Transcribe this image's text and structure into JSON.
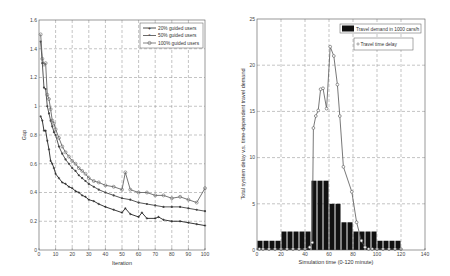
{
  "chart_data": [
    {
      "type": "line",
      "title": "",
      "xlabel": "Iteration",
      "ylabel": "Gap",
      "xlim": [
        0,
        100
      ],
      "ylim": [
        0,
        1.6
      ],
      "xticks": [
        "0",
        "10",
        "20",
        "30",
        "40",
        "50",
        "60",
        "70",
        "80",
        "90",
        "100"
      ],
      "yticks": [
        "0",
        "0.2",
        "0.4",
        "0.6",
        "0.8",
        "1",
        "1.2",
        "1.4",
        "1.6"
      ],
      "grid": true,
      "legend_position": "upper right",
      "series": [
        {
          "name": "20% guided users",
          "color": "#222222",
          "marker": "+",
          "x": [
            1,
            2,
            3,
            4,
            5,
            6,
            7,
            8,
            9,
            10,
            12,
            14,
            16,
            18,
            20,
            22,
            24,
            26,
            28,
            30,
            33,
            36,
            40,
            45,
            50,
            52,
            55,
            60,
            62,
            65,
            70,
            72,
            75,
            80,
            85,
            90,
            95,
            100
          ],
          "values": [
            0.93,
            0.9,
            0.83,
            0.83,
            0.76,
            0.7,
            0.62,
            0.6,
            0.57,
            0.53,
            0.5,
            0.47,
            0.46,
            0.44,
            0.43,
            0.41,
            0.4,
            0.38,
            0.37,
            0.35,
            0.34,
            0.32,
            0.3,
            0.28,
            0.26,
            0.29,
            0.25,
            0.23,
            0.26,
            0.22,
            0.22,
            0.23,
            0.21,
            0.2,
            0.2,
            0.19,
            0.18,
            0.17
          ]
        },
        {
          "name": "50% guided users",
          "color": "#444444",
          "marker": "*",
          "x": [
            1,
            2,
            3,
            4,
            5,
            6,
            7,
            8,
            9,
            10,
            12,
            14,
            16,
            18,
            20,
            22,
            24,
            26,
            28,
            30,
            33,
            36,
            40,
            45,
            50,
            55,
            60,
            65,
            70,
            75,
            80,
            85,
            90,
            95,
            100
          ],
          "values": [
            1.45,
            1.3,
            1.13,
            1.12,
            1.0,
            0.95,
            0.9,
            0.86,
            0.82,
            0.8,
            0.72,
            0.67,
            0.63,
            0.6,
            0.57,
            0.55,
            0.52,
            0.5,
            0.48,
            0.46,
            0.44,
            0.42,
            0.4,
            0.38,
            0.36,
            0.35,
            0.33,
            0.32,
            0.31,
            0.3,
            0.3,
            0.3,
            0.29,
            0.28,
            0.27
          ]
        },
        {
          "name": "100% guided users",
          "color": "#666666",
          "marker": "o",
          "x": [
            1,
            2,
            3,
            4,
            5,
            6,
            7,
            8,
            9,
            10,
            12,
            14,
            16,
            18,
            20,
            22,
            24,
            26,
            28,
            30,
            33,
            36,
            40,
            45,
            50,
            52,
            55,
            60,
            65,
            70,
            75,
            80,
            85,
            90,
            95,
            100
          ],
          "values": [
            1.5,
            1.33,
            1.29,
            1.3,
            1.08,
            1.05,
            0.98,
            0.9,
            0.88,
            0.84,
            0.78,
            0.72,
            0.68,
            0.65,
            0.62,
            0.6,
            0.57,
            0.55,
            0.53,
            0.5,
            0.48,
            0.47,
            0.45,
            0.44,
            0.42,
            0.54,
            0.42,
            0.4,
            0.4,
            0.38,
            0.38,
            0.36,
            0.37,
            0.35,
            0.33,
            0.43
          ]
        }
      ]
    },
    {
      "type": "bar+line",
      "title": "",
      "xlabel": "Simulation time (0-120 minute)",
      "ylabel": "Total system delay v.s. time-dependent travel demand",
      "xlim": [
        0,
        140
      ],
      "ylim": [
        0,
        25
      ],
      "xticks": [
        "0",
        "20",
        "40",
        "60",
        "80",
        "100",
        "120",
        "140"
      ],
      "yticks": [
        "0",
        "5",
        "10",
        "15",
        "20",
        "25"
      ],
      "grid": true,
      "legend_position": "upper right",
      "series": [
        {
          "name": "Travel demand in 1000 cars/h",
          "type": "bar",
          "color": "#111111",
          "x": [
            2.5,
            7.5,
            12.5,
            17.5,
            22.5,
            27.5,
            32.5,
            37.5,
            42.5,
            47.5,
            52.5,
            57.5,
            62.5,
            67.5,
            72.5,
            77.5,
            82.5,
            87.5,
            92.5,
            97.5,
            102.5,
            107.5,
            112.5,
            117.5
          ],
          "values": [
            1,
            1,
            1,
            1,
            2,
            2,
            2,
            2,
            2,
            7.5,
            7.5,
            7.5,
            5,
            5,
            3,
            3,
            2,
            2,
            2,
            2,
            1,
            1,
            1,
            1
          ]
        },
        {
          "name": "Travel time delay",
          "type": "line",
          "color": "#555555",
          "marker": "o",
          "x": [
            2,
            5,
            10,
            15,
            20,
            25,
            30,
            35,
            40,
            44,
            46,
            47,
            49,
            51,
            53,
            55,
            58,
            61,
            64,
            67,
            69,
            72,
            79,
            83,
            87,
            90,
            93,
            96,
            100,
            105,
            110,
            115,
            120
          ],
          "values": [
            0.1,
            0.1,
            0.1,
            0.1,
            0.1,
            0.1,
            0.1,
            0.1,
            0.1,
            0.3,
            0.8,
            13.2,
            14.5,
            15.1,
            17.4,
            17.5,
            15.3,
            22.0,
            21.0,
            17.9,
            14.5,
            9.0,
            6.3,
            3.0,
            1.0,
            0.3,
            0.1,
            0.1,
            0.1,
            0.1,
            0.1,
            0.1,
            0.1
          ]
        }
      ]
    }
  ],
  "left": {
    "xlabel": "Iteration",
    "ylabel": "Gap",
    "legend": [
      "20% guided users",
      "50% guided users",
      "100% guided users"
    ]
  },
  "right": {
    "xlabel": "Simulation time (0-120 minute)",
    "ylabel": "Total system delay v.s. time-dependent travel demand",
    "legend_bar": "Travel demand in 1000 cars/h",
    "legend_line": "Travel time delay"
  }
}
